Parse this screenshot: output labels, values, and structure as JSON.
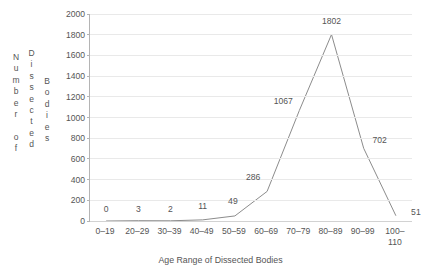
{
  "chart_data": {
    "type": "line",
    "title": "",
    "xlabel": "Age Range of Dissected Bodies",
    "ylabel": "Number of Dissected Bodies",
    "ylabel_columns": [
      "Number of",
      "Dissected",
      "Bodies"
    ],
    "categories": [
      "0–19",
      "20–29",
      "30–39",
      "40–49",
      "50–59",
      "60–69",
      "70–79",
      "80–89",
      "90–99",
      "100–110"
    ],
    "values": [
      0,
      3,
      2,
      11,
      49,
      286,
      1067,
      1802,
      702,
      51
    ],
    "point_labels": [
      "0",
      "3",
      "2",
      "11",
      "49",
      "286",
      "1067",
      "1802",
      "702",
      "51"
    ],
    "ylim": [
      0,
      2000
    ],
    "ytick_labels": [
      "0",
      "200",
      "400",
      "600",
      "800",
      "1000",
      "1200",
      "1400",
      "1600",
      "1800",
      "2000"
    ],
    "ytick_values": [
      0,
      200,
      400,
      600,
      800,
      1000,
      1200,
      1400,
      1600,
      1800,
      2000
    ],
    "grid": true,
    "legend": "none",
    "series_color": "#8c8c8c",
    "grid_color": "#e9e9e9",
    "axis_color": "#b4b4b4",
    "text_color": "#555555",
    "background": "#ffffff"
  },
  "yaxis_title": {
    "col1_letters": [
      "N",
      "u",
      "m",
      "b",
      "e",
      "r",
      "",
      "o",
      "f"
    ],
    "col2_letters": [
      "D",
      "i",
      "s",
      "s",
      "e",
      "c",
      "t",
      "e",
      "d"
    ],
    "col3_letters": [
      "B",
      "o",
      "d",
      "i",
      "e",
      "s"
    ]
  }
}
